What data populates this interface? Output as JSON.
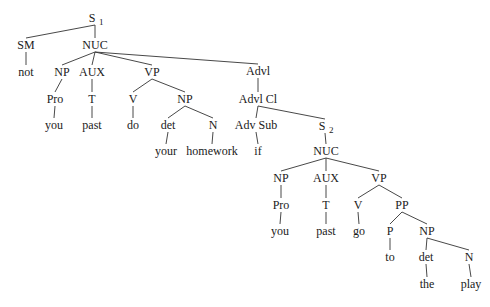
{
  "diagram": {
    "type": "syntax-tree",
    "colors": {
      "line": "#333333",
      "text": "#1a1a1a",
      "background": "#ffffff"
    },
    "nodes": [
      {
        "id": "s1",
        "label": "S",
        "sub": "1",
        "x": 95,
        "y": 22
      },
      {
        "id": "sm",
        "label": "SM",
        "x": 26,
        "y": 49
      },
      {
        "id": "nuc1",
        "label": "NUC",
        "x": 95,
        "y": 49
      },
      {
        "id": "not",
        "label": "not",
        "x": 26,
        "y": 76
      },
      {
        "id": "np1",
        "label": "NP",
        "x": 62,
        "y": 76
      },
      {
        "id": "aux1",
        "label": "AUX",
        "x": 92,
        "y": 76
      },
      {
        "id": "vp1",
        "label": "VP",
        "x": 152,
        "y": 76
      },
      {
        "id": "advl",
        "label": "Advl",
        "x": 258,
        "y": 75
      },
      {
        "id": "pro1",
        "label": "Pro",
        "x": 55,
        "y": 103
      },
      {
        "id": "t1",
        "label": "T",
        "x": 92,
        "y": 103
      },
      {
        "id": "v1",
        "label": "V",
        "x": 133,
        "y": 103
      },
      {
        "id": "np2",
        "label": "NP",
        "x": 185,
        "y": 103
      },
      {
        "id": "advlcl",
        "label": "Advl Cl",
        "x": 258,
        "y": 103
      },
      {
        "id": "you1",
        "label": "you",
        "x": 54,
        "y": 129
      },
      {
        "id": "past1",
        "label": "past",
        "x": 92,
        "y": 129
      },
      {
        "id": "do",
        "label": "do",
        "x": 133,
        "y": 129
      },
      {
        "id": "det1",
        "label": "det",
        "x": 168,
        "y": 129
      },
      {
        "id": "n1",
        "label": "N",
        "x": 213,
        "y": 129
      },
      {
        "id": "advsub",
        "label": "Adv Sub",
        "x": 256,
        "y": 129
      },
      {
        "id": "s2",
        "label": "S",
        "sub": "2",
        "x": 325,
        "y": 130
      },
      {
        "id": "your",
        "label": "your",
        "x": 166,
        "y": 155
      },
      {
        "id": "homework",
        "label": "homework",
        "x": 212,
        "y": 155
      },
      {
        "id": "if",
        "label": "if",
        "x": 258,
        "y": 155
      },
      {
        "id": "nuc2",
        "label": "NUC",
        "x": 326,
        "y": 155
      },
      {
        "id": "np3",
        "label": "NP",
        "x": 281,
        "y": 182
      },
      {
        "id": "aux2",
        "label": "AUX",
        "x": 326,
        "y": 182
      },
      {
        "id": "vp2",
        "label": "VP",
        "x": 379,
        "y": 182
      },
      {
        "id": "pro2",
        "label": "Pro",
        "x": 281,
        "y": 209
      },
      {
        "id": "t2",
        "label": "T",
        "x": 326,
        "y": 209
      },
      {
        "id": "v2",
        "label": "V",
        "x": 358,
        "y": 209
      },
      {
        "id": "pp",
        "label": "PP",
        "x": 402,
        "y": 209
      },
      {
        "id": "you2",
        "label": "you",
        "x": 280,
        "y": 235
      },
      {
        "id": "past2",
        "label": "past",
        "x": 326,
        "y": 235
      },
      {
        "id": "go",
        "label": "go",
        "x": 359,
        "y": 235
      },
      {
        "id": "p",
        "label": "P",
        "x": 390,
        "y": 235
      },
      {
        "id": "np4",
        "label": "NP",
        "x": 427,
        "y": 235
      },
      {
        "id": "to",
        "label": "to",
        "x": 390,
        "y": 261
      },
      {
        "id": "det2",
        "label": "det",
        "x": 426,
        "y": 261
      },
      {
        "id": "n2",
        "label": "N",
        "x": 469,
        "y": 261
      },
      {
        "id": "the",
        "label": "the",
        "x": 427,
        "y": 288
      },
      {
        "id": "play",
        "label": "play",
        "x": 471,
        "y": 288
      }
    ],
    "edges": [
      [
        "s1",
        "sm"
      ],
      [
        "s1",
        "nuc1"
      ],
      [
        "sm",
        "not"
      ],
      [
        "nuc1",
        "np1"
      ],
      [
        "nuc1",
        "aux1"
      ],
      [
        "nuc1",
        "vp1"
      ],
      [
        "nuc1",
        "advl"
      ],
      [
        "np1",
        "pro1"
      ],
      [
        "pro1",
        "you1"
      ],
      [
        "aux1",
        "t1"
      ],
      [
        "t1",
        "past1"
      ],
      [
        "vp1",
        "v1"
      ],
      [
        "vp1",
        "np2"
      ],
      [
        "v1",
        "do"
      ],
      [
        "np2",
        "det1"
      ],
      [
        "np2",
        "n1"
      ],
      [
        "det1",
        "your"
      ],
      [
        "n1",
        "homework"
      ],
      [
        "advl",
        "advlcl"
      ],
      [
        "advlcl",
        "advsub"
      ],
      [
        "advlcl",
        "s2"
      ],
      [
        "advsub",
        "if"
      ],
      [
        "s2",
        "nuc2"
      ],
      [
        "nuc2",
        "np3"
      ],
      [
        "nuc2",
        "aux2"
      ],
      [
        "nuc2",
        "vp2"
      ],
      [
        "np3",
        "pro2"
      ],
      [
        "pro2",
        "you2"
      ],
      [
        "aux2",
        "t2"
      ],
      [
        "t2",
        "past2"
      ],
      [
        "vp2",
        "v2"
      ],
      [
        "vp2",
        "pp"
      ],
      [
        "v2",
        "go"
      ],
      [
        "pp",
        "p"
      ],
      [
        "pp",
        "np4"
      ],
      [
        "p",
        "to"
      ],
      [
        "np4",
        "det2"
      ],
      [
        "np4",
        "n2"
      ],
      [
        "det2",
        "the"
      ],
      [
        "n2",
        "play"
      ]
    ]
  }
}
